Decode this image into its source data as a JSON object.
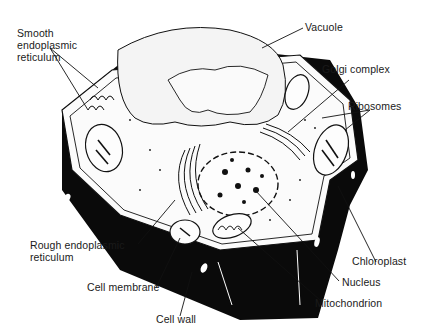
{
  "figure": {
    "colors": {
      "ink": "#111111",
      "wall": "#0a0a0a",
      "cytoplasm": "#fbfbfb",
      "vacuole": "#f6f6f6",
      "background": "#ffffff"
    }
  },
  "labels": {
    "smooth_er": "Smooth\nendoplasmic\nreticulum",
    "vacuole": "Vacuole",
    "golgi": "Golgi complex",
    "ribosomes": "Ribosomes",
    "rough_er": "Rough endoplasmic\nreticulum",
    "cell_membrane": "Cell membrane",
    "cell_wall": "Cell wall",
    "chloroplast": "Chloroplast",
    "nucleus": "Nucleus",
    "mitochondrion": "Mitochondrion"
  }
}
